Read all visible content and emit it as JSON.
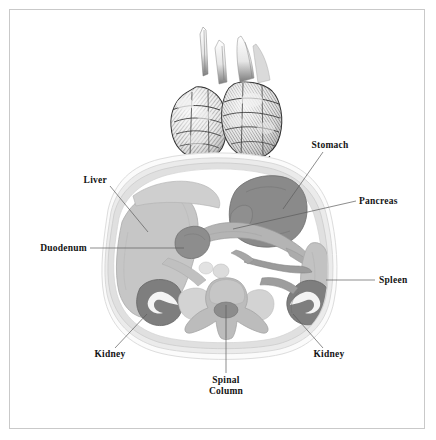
{
  "figure": {
    "background_color": "#ffffff",
    "border_color": "#c9c9c9",
    "label_color": "#141414",
    "leader_color": "#5b5b5b"
  },
  "palette": {
    "skin_outline": "#f2f2f2",
    "fat_layer": "#e4e4e4",
    "muscle_wall": "#dcdcdc",
    "liver_fill": "#c6c6c6",
    "stomach_fill": "#8a8a8a",
    "pancreas_fill": "#b4b4b4",
    "duodenum_fill": "#8d8d8d",
    "spleen_fill": "#c2c2c2",
    "kidney_fill": "#7e7e7e",
    "kidney_hilum": "#f4f4f4",
    "vertebra_fill": "#bcbcbc",
    "spinal_canal": "#8c8c8c",
    "cavity_fill": "#ffffff",
    "engraving_dark": "#3a3a3a",
    "engraving_mid": "#9a9a9a",
    "engraving_light": "#d8d8d8"
  },
  "labels": [
    {
      "id": "stomach",
      "text": "Stomach",
      "anchor": "middle",
      "x": 330,
      "y": 148,
      "leader": "M 323 152 L 283 209"
    },
    {
      "id": "pancreas",
      "text": "Pancreas",
      "anchor": "start",
      "x": 359,
      "y": 204,
      "leader": "M 356 201 L 233 229"
    },
    {
      "id": "spleen",
      "text": "Spleen",
      "anchor": "start",
      "x": 379,
      "y": 283,
      "leader": "M 375 280 L 326 280"
    },
    {
      "id": "liver",
      "text": "Liver",
      "anchor": "end",
      "x": 107,
      "y": 183,
      "leader": "M 110 186 L 148 232"
    },
    {
      "id": "duodenum",
      "text": "Duodenum",
      "anchor": "end",
      "x": 87,
      "y": 251,
      "leader": "M 90 248 L 184 248"
    },
    {
      "id": "kidney-left",
      "text": "Kidney",
      "anchor": "middle",
      "x": 110,
      "y": 357,
      "leader": "M 115 348 L 147 314"
    },
    {
      "id": "kidney-right",
      "text": "Kidney",
      "anchor": "middle",
      "x": 329,
      "y": 357,
      "leader": "M 323 348 L 293 314"
    }
  ],
  "multiline_labels": [
    {
      "id": "spinal-column",
      "lines": [
        "Spinal",
        "Column"
      ],
      "anchor": "middle",
      "x": 226,
      "y": 383,
      "line_height": 11,
      "leader": "M 226 373 L 226 305"
    }
  ]
}
